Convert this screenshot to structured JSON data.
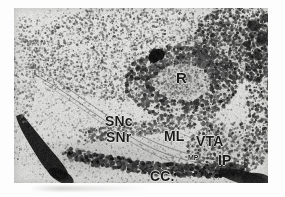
{
  "figure": {
    "kind": "histology-autoradiograph",
    "caption_present": false,
    "plate": {
      "left": 14,
      "top": 8,
      "width": 254,
      "height": 175,
      "background_color": "#d8d8d6",
      "ink_color": "#1b1b1b",
      "page_color": "#ffffff"
    }
  },
  "annotations": [
    {
      "id": "red-nucleus",
      "text": "R",
      "x": 162,
      "y": 62,
      "size": "sz-lg"
    },
    {
      "id": "substantia-nigra-compacta",
      "text": "SNc",
      "x": 91,
      "y": 106,
      "size": "sz-md"
    },
    {
      "id": "substantia-nigra-reticulata",
      "text": "SNr",
      "x": 92,
      "y": 122,
      "size": "sz-md"
    },
    {
      "id": "medial-lemniscus",
      "text": "ML",
      "x": 150,
      "y": 121,
      "size": "sz-md"
    },
    {
      "id": "ventral-tegmental-area",
      "text": "VTA",
      "x": 182,
      "y": 126,
      "size": "sz-md"
    },
    {
      "id": "mammillary-peduncle",
      "text": "MP",
      "x": 174,
      "y": 146,
      "size": "sz-sm"
    },
    {
      "id": "interpeduncular-nucleus",
      "text": "IP",
      "x": 204,
      "y": 145,
      "size": "sz-md"
    },
    {
      "id": "crus-cerebri",
      "text": "CC.",
      "x": 136,
      "y": 161,
      "size": "sz-md"
    }
  ],
  "structures": {
    "dark_blob_above_R": {
      "x": 143,
      "y": 47,
      "rx": 8,
      "ry": 6
    },
    "left_fiber_tract": {
      "description": "cerebral-peduncle-dark-band"
    },
    "bottom_right_tract": {
      "description": "dark-fiber-band"
    }
  }
}
